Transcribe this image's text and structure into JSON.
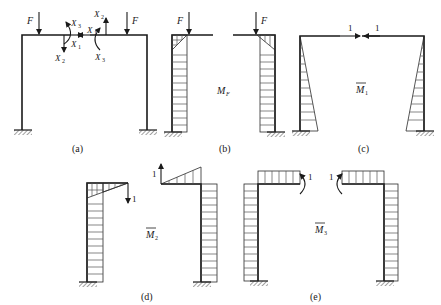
{
  "figure": {
    "panels": [
      {
        "id": "a",
        "caption": "(a)",
        "loads": [
          "F",
          "F"
        ],
        "unknowns": {
          "x1": "X",
          "x1_sub": "1",
          "x2": "X",
          "x2_sub": "2",
          "x3": "X",
          "x3_sub": "3"
        }
      },
      {
        "id": "b",
        "caption": "(b)",
        "loads": [
          "F",
          "F"
        ],
        "moment_label": "M",
        "moment_sub": "F"
      },
      {
        "id": "c",
        "caption": "(c)",
        "unit_loads": [
          "1",
          "1"
        ],
        "moment_label": "M",
        "moment_sub": "1"
      },
      {
        "id": "d",
        "caption": "(d)",
        "unit_loads": [
          "1",
          "1"
        ],
        "moment_label": "M",
        "moment_sub": "2"
      },
      {
        "id": "e",
        "caption": "(e)",
        "unit_moments": [
          "1",
          "1"
        ],
        "moment_label": "M",
        "moment_sub": "3"
      }
    ]
  }
}
